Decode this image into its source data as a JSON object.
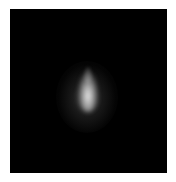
{
  "image": {
    "background_color": "#ffffff",
    "frame_color": "#000000",
    "subject": "bright-point-source",
    "spot_color": "#e8e8e8"
  }
}
